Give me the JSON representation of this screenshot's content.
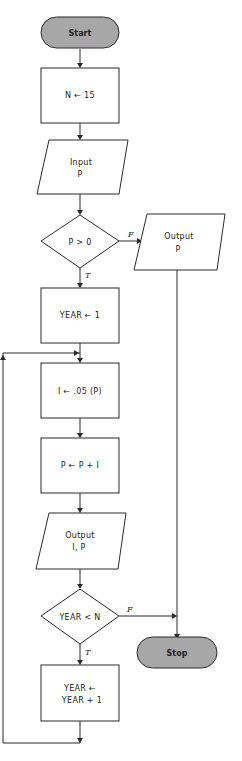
{
  "flowchart": {
    "nodes": {
      "start": {
        "type": "terminal",
        "label": "Start"
      },
      "init_n": {
        "type": "process",
        "label": "N ← 15"
      },
      "input_p": {
        "type": "io",
        "line1": "Input",
        "line2": "P"
      },
      "check_p": {
        "type": "decision",
        "label": "P > 0"
      },
      "output_p": {
        "type": "io",
        "line1": "Output",
        "line2": "P"
      },
      "init_year": {
        "type": "process",
        "label": "YEAR ← 1"
      },
      "calc_i": {
        "type": "process",
        "label": "I ← .05 (P)"
      },
      "update_p": {
        "type": "process",
        "label": "P ← P + I"
      },
      "output_ip": {
        "type": "io",
        "line1": "Output",
        "line2": "I, P"
      },
      "check_year": {
        "type": "decision",
        "label": "YEAR < N"
      },
      "stop": {
        "type": "terminal",
        "label": "Stop"
      },
      "inc_year": {
        "type": "process",
        "line1": "YEAR ←",
        "line2": "YEAR + 1"
      }
    },
    "branch_labels": {
      "check_p_false": "F",
      "check_p_true": "T",
      "check_year_false": "F",
      "check_year_true": "T"
    },
    "edges": [
      {
        "from": "start",
        "to": "init_n"
      },
      {
        "from": "init_n",
        "to": "input_p"
      },
      {
        "from": "input_p",
        "to": "check_p"
      },
      {
        "from": "check_p",
        "to": "output_p",
        "label": "F"
      },
      {
        "from": "check_p",
        "to": "init_year",
        "label": "T"
      },
      {
        "from": "output_p",
        "to": "stop"
      },
      {
        "from": "init_year",
        "to": "calc_i"
      },
      {
        "from": "calc_i",
        "to": "update_p"
      },
      {
        "from": "update_p",
        "to": "output_ip"
      },
      {
        "from": "output_ip",
        "to": "check_year"
      },
      {
        "from": "check_year",
        "to": "stop",
        "label": "F"
      },
      {
        "from": "check_year",
        "to": "inc_year",
        "label": "T"
      },
      {
        "from": "inc_year",
        "to": "calc_i",
        "label": "loop"
      }
    ],
    "colors": {
      "terminal_fill": "#a7a7a7",
      "stroke": "#2a2a2a",
      "background": "#ffffff"
    }
  }
}
